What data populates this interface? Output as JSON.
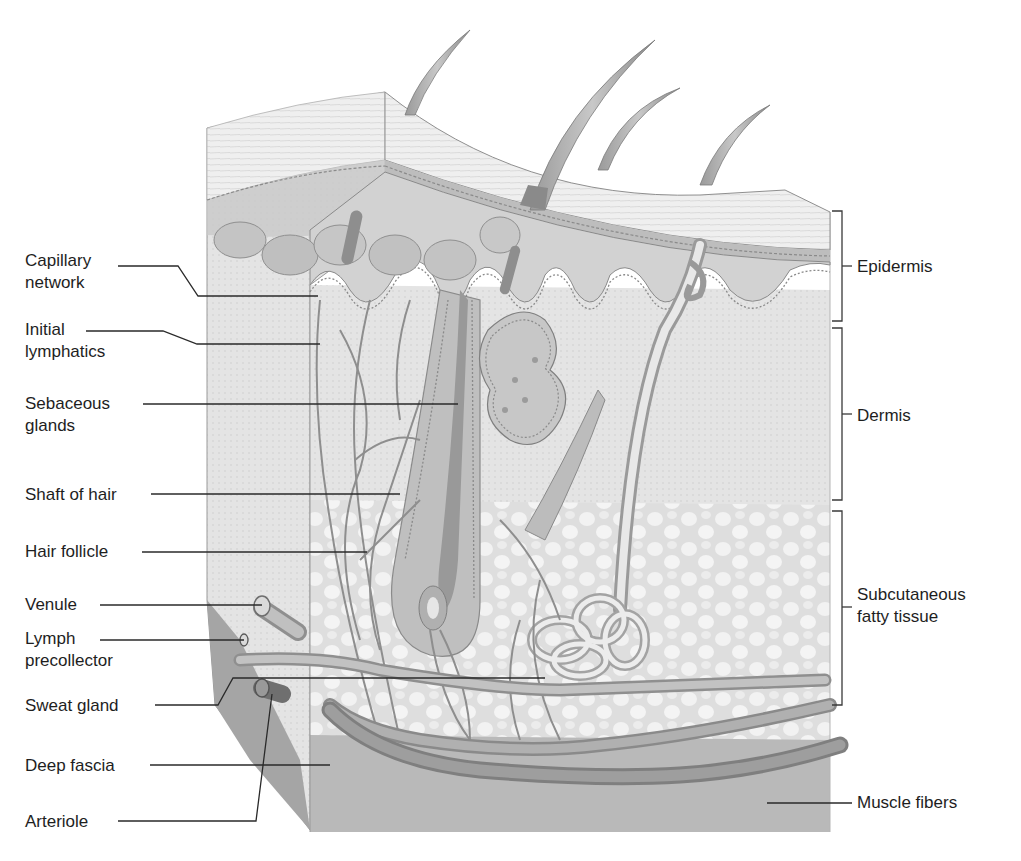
{
  "figure": {
    "left_labels": [
      {
        "id": "capillary-network",
        "text": "Capillary\nnetwork",
        "x": 25,
        "y": 250
      },
      {
        "id": "initial-lymphatics",
        "text": "Initial\nlymphatics",
        "x": 25,
        "y": 319
      },
      {
        "id": "sebaceous-glands",
        "text": "Sebaceous\nglands",
        "x": 25,
        "y": 393
      },
      {
        "id": "shaft-of-hair",
        "text": "Shaft of hair",
        "x": 25,
        "y": 484
      },
      {
        "id": "hair-follicle",
        "text": "Hair follicle",
        "x": 25,
        "y": 541
      },
      {
        "id": "venule",
        "text": "Venule",
        "x": 25,
        "y": 594
      },
      {
        "id": "lymph-precollector",
        "text": "Lymph\nprecollector",
        "x": 25,
        "y": 628
      },
      {
        "id": "sweat-gland",
        "text": "Sweat gland",
        "x": 25,
        "y": 695
      },
      {
        "id": "deep-fascia",
        "text": "Deep fascia",
        "x": 25,
        "y": 755
      },
      {
        "id": "arteriole",
        "text": "Arteriole",
        "x": 25,
        "y": 811
      }
    ],
    "right_labels": [
      {
        "id": "epidermis",
        "text": "Epidermis",
        "x": 857,
        "y": 256
      },
      {
        "id": "dermis",
        "text": "Dermis",
        "x": 857,
        "y": 405
      },
      {
        "id": "subcutaneous-fatty-tissue",
        "text": "Subcutaneous\nfatty tissue",
        "x": 857,
        "y": 584
      },
      {
        "id": "muscle-fibers",
        "text": "Muscle fibers",
        "x": 857,
        "y": 792
      }
    ],
    "brackets": [
      {
        "id": "epidermis-bracket",
        "top": 211,
        "bottom": 321
      },
      {
        "id": "dermis-bracket",
        "top": 328,
        "bottom": 500
      },
      {
        "id": "subcutaneous-bracket",
        "top": 511,
        "bottom": 705
      }
    ],
    "colors": {
      "background": "#ffffff",
      "text": "#1e1e1e",
      "leader_line": "#2a2a2a",
      "tissue_light": "#e6e6e6",
      "tissue_mid": "#cfcfcf",
      "tissue_dark": "#a8a8a8",
      "vessel": "#8e8e8e",
      "fascia": "#b5b5b5"
    }
  }
}
